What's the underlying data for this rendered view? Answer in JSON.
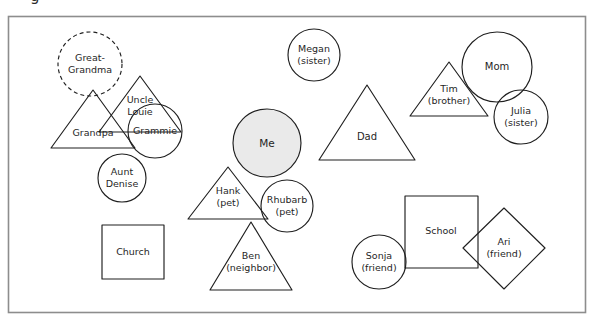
{
  "page": {
    "cropped_header_text": "g",
    "frame": {
      "x": 8,
      "y": 16,
      "width": 577,
      "height": 296,
      "stroke": "#8d8d8d"
    },
    "background_color": "#ffffff",
    "ink_color": "#1f1f1f",
    "highlight_fill": "#eaeaea"
  },
  "chart_data": {
    "type": "diagram",
    "title": "",
    "subtitle": "",
    "shape_legend": [
      {
        "shape": "circle",
        "meaning": "circle"
      },
      {
        "shape": "triangle",
        "meaning": "triangle"
      },
      {
        "shape": "square",
        "meaning": "square"
      },
      {
        "shape": "diamond",
        "meaning": "diamond"
      },
      {
        "shape": "dashed-circle",
        "meaning": "dashed circle"
      }
    ],
    "nodes": [
      {
        "id": "great-grandma",
        "label_lines": [
          "Great-",
          "Grandma"
        ],
        "shape": "circle",
        "dashed": true,
        "filled": false,
        "cx": 90,
        "cy": 64,
        "r": 32,
        "label_x": 90,
        "label_y": 64,
        "font_size": 9.5
      },
      {
        "id": "uncle-louie",
        "label_lines": [
          "Uncle",
          "Louie"
        ],
        "shape": "triangle",
        "dashed": false,
        "filled": false,
        "cx": 140,
        "cy": 104,
        "points": "140,76 181,132 99,132",
        "label_x": 140,
        "label_y": 106,
        "font_size": 9.5
      },
      {
        "id": "grandpa",
        "label_lines": [
          "Grandpa"
        ],
        "shape": "triangle",
        "dashed": false,
        "filled": false,
        "cx": 93,
        "cy": 119,
        "points": "93,90 135,148 51,148",
        "label_x": 93,
        "label_y": 133,
        "font_size": 9.5
      },
      {
        "id": "grammie",
        "label_lines": [
          "Grammie"
        ],
        "shape": "circle",
        "dashed": false,
        "filled": false,
        "cx": 155,
        "cy": 131,
        "r": 27,
        "label_x": 155,
        "label_y": 131,
        "font_size": 9.5
      },
      {
        "id": "aunt-denise",
        "label_lines": [
          "Aunt",
          "Denise"
        ],
        "shape": "circle",
        "dashed": false,
        "filled": false,
        "cx": 122,
        "cy": 178,
        "r": 24,
        "label_x": 122,
        "label_y": 178,
        "font_size": 9.5
      },
      {
        "id": "church",
        "label_lines": [
          "Church"
        ],
        "shape": "square",
        "dashed": false,
        "filled": false,
        "x": 102,
        "y": 225,
        "width": 62,
        "height": 54,
        "label_x": 133,
        "label_y": 252,
        "font_size": 9.5
      },
      {
        "id": "megan",
        "label_lines": [
          "Megan",
          "(sister)"
        ],
        "shape": "circle",
        "dashed": false,
        "filled": false,
        "cx": 314,
        "cy": 55,
        "r": 26,
        "label_x": 314,
        "label_y": 55,
        "font_size": 9.5
      },
      {
        "id": "me",
        "label_lines": [
          "Me"
        ],
        "shape": "circle",
        "dashed": false,
        "filled": true,
        "cx": 267,
        "cy": 143,
        "r": 34,
        "label_x": 267,
        "label_y": 144,
        "font_size": 10.5
      },
      {
        "id": "hank",
        "label_lines": [
          "Hank",
          "(pet)"
        ],
        "shape": "triangle",
        "dashed": false,
        "filled": false,
        "cx": 228,
        "cy": 196,
        "points": "228,167 268,219 188,219",
        "label_x": 228,
        "label_y": 197,
        "font_size": 9.5
      },
      {
        "id": "rhubarb",
        "label_lines": [
          "Rhubarb",
          "(pet)"
        ],
        "shape": "circle",
        "dashed": false,
        "filled": false,
        "cx": 287,
        "cy": 206,
        "r": 26,
        "label_x": 287,
        "label_y": 206,
        "font_size": 9.5
      },
      {
        "id": "ben",
        "label_lines": [
          "Ben",
          "(neighbor)"
        ],
        "shape": "triangle",
        "dashed": false,
        "filled": false,
        "cx": 251,
        "cy": 255,
        "points": "251,222 292,290 210,290",
        "label_x": 251,
        "label_y": 262,
        "font_size": 9.5
      },
      {
        "id": "dad",
        "label_lines": [
          "Dad"
        ],
        "shape": "triangle",
        "dashed": false,
        "filled": false,
        "cx": 367,
        "cy": 122,
        "points": "367,85 415,160 319,160",
        "label_x": 367,
        "label_y": 137,
        "font_size": 10
      },
      {
        "id": "tim",
        "label_lines": [
          "Tim",
          "(brother)"
        ],
        "shape": "triangle",
        "dashed": false,
        "filled": false,
        "cx": 449,
        "cy": 94,
        "points": "449,62 488,116 410,116",
        "label_x": 449,
        "label_y": 95,
        "font_size": 9.5
      },
      {
        "id": "mom",
        "label_lines": [
          "Mom"
        ],
        "shape": "circle",
        "dashed": false,
        "filled": false,
        "cx": 497,
        "cy": 67,
        "r": 35,
        "label_x": 497,
        "label_y": 67,
        "font_size": 10
      },
      {
        "id": "julia",
        "label_lines": [
          "Julia",
          "(sister)"
        ],
        "shape": "circle",
        "dashed": false,
        "filled": false,
        "cx": 521,
        "cy": 117,
        "r": 27,
        "label_x": 521,
        "label_y": 117,
        "font_size": 9.5
      },
      {
        "id": "school",
        "label_lines": [
          "School"
        ],
        "shape": "square",
        "dashed": false,
        "filled": false,
        "x": 405,
        "y": 196,
        "width": 73,
        "height": 72,
        "label_x": 441,
        "label_y": 231,
        "font_size": 9.5
      },
      {
        "id": "sonja",
        "label_lines": [
          "Sonja",
          "(friend)"
        ],
        "shape": "circle",
        "dashed": false,
        "filled": false,
        "cx": 379,
        "cy": 262,
        "r": 27,
        "label_x": 379,
        "label_y": 262,
        "font_size": 9.5
      },
      {
        "id": "ari",
        "label_lines": [
          "Ari",
          "(friend)"
        ],
        "shape": "diamond",
        "dashed": false,
        "filled": false,
        "cx": 504,
        "cy": 248,
        "points": "504,208 545,248 504,289 463,248",
        "label_x": 504,
        "label_y": 248,
        "font_size": 9.5
      }
    ]
  }
}
